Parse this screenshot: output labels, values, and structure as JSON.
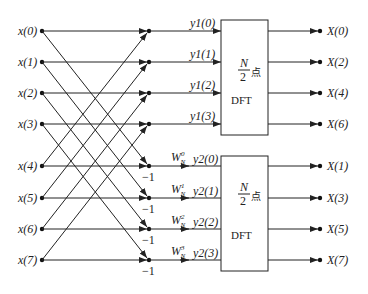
{
  "diagram": {
    "title": "",
    "type": "radix-2 DIT FFT first stage butterfly (N=8)",
    "inputs": [
      "x(0)",
      "x(1)",
      "x(2)",
      "x(3)",
      "x(4)",
      "x(5)",
      "x(6)",
      "x(7)"
    ],
    "upper_branch_labels": [
      "y1(0)",
      "y1(1)",
      "y1(2)",
      "y1(3)"
    ],
    "lower_branch_labels": [
      "y2(0)",
      "y2(1)",
      "y2(2)",
      "y2(3)"
    ],
    "twiddle_factors": [
      "W_N^0",
      "W_N^1",
      "W_N^2",
      "W_N^3"
    ],
    "minus_one_label": "−1",
    "box_top": {
      "line1_num": "N",
      "line1_den": "2",
      "line1_unit": "点",
      "line2": "DFT"
    },
    "box_bottom": {
      "line1_num": "N",
      "line1_den": "2",
      "line1_unit": "点",
      "line2": "DFT"
    },
    "outputs_top": [
      "X(0)",
      "X(2)",
      "X(4)",
      "X(6)"
    ],
    "outputs_bottom": [
      "X(1)",
      "X(3)",
      "X(5)",
      "X(7)"
    ]
  }
}
